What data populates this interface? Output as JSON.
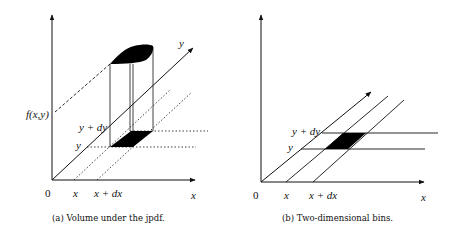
{
  "figure": {
    "panel_a": {
      "caption": "(a) Volume under the jpdf.",
      "labels": {
        "origin": "0",
        "x_tick": "x",
        "x_dx_tick": "x + dx",
        "x_axis": "x",
        "y_axis": "y",
        "y_tick": "y",
        "y_dy_tick": "y + dy",
        "f_value": "f(x,y)"
      }
    },
    "panel_b": {
      "caption": "(b) Two-dimensional bins.",
      "labels": {
        "origin": "0",
        "x_tick": "x",
        "x_dx_tick": "x + dx",
        "x_axis": "x",
        "y_tick": "y",
        "y_dy_tick": "y + dy"
      }
    },
    "colors": {
      "ink": "#111111",
      "fill": "#000000",
      "background": "#ffffff"
    }
  }
}
